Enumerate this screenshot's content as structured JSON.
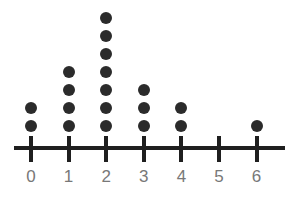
{
  "chart_data": {
    "type": "scatter",
    "plot_style": "dot-plot",
    "title": "",
    "subtitle": "",
    "xlabel": "",
    "ylabel": "",
    "categories": [
      "0",
      "1",
      "2",
      "3",
      "4",
      "5",
      "6"
    ],
    "x": [
      0,
      1,
      2,
      3,
      4,
      5,
      6
    ],
    "values": [
      2,
      4,
      7,
      3,
      2,
      0,
      1
    ],
    "tick_labels": [
      "0",
      "1",
      "2",
      "3",
      "4",
      "5",
      "6"
    ],
    "total_dots": 19,
    "dot_unit": 1,
    "xlim": [
      0,
      6
    ],
    "ylim": [
      0,
      7
    ],
    "grid": false,
    "legend": null,
    "annotations": [],
    "series": [
      {
        "name": "counts",
        "values": [
          2,
          4,
          7,
          3,
          2,
          0,
          1
        ]
      }
    ]
  },
  "style": {
    "background_color": "#ffffff",
    "dot_color": "#2b2b2b",
    "axis_color": "#1f1f1f",
    "label_color": "#787878"
  },
  "geometry": {
    "axis_y": 148,
    "axis_x_start": 14,
    "axis_x_end": 285,
    "axis_thickness": 4,
    "tick_x_first": 31,
    "tick_spacing": 37.6,
    "tick_top": 136,
    "tick_height": 26,
    "tick_thickness": 4,
    "dot_diameter": 12,
    "dot_row_spacing": 18,
    "dot_bottom_center_y": 126,
    "label_y": 168
  }
}
